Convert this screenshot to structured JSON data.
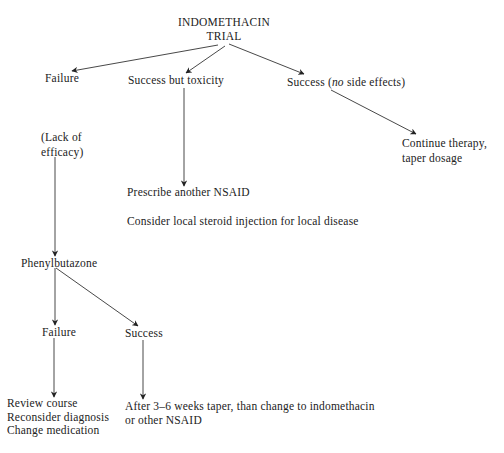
{
  "diagram": {
    "type": "flowchart",
    "nodes": {
      "root": {
        "lines": [
          "INDOMETHACIN",
          "TRIAL"
        ]
      },
      "failure_1": {
        "label": "Failure"
      },
      "success_toxicity": {
        "label": "Success but toxicity"
      },
      "success_no_side": {
        "prefix": "Success (",
        "italic": "no",
        "suffix": " side effects)"
      },
      "lack_efficacy": {
        "lines": [
          "(Lack of",
          "efficacy)"
        ]
      },
      "prescribe_nsaid": {
        "label": "Prescribe another NSAID"
      },
      "consider_steroid": {
        "label": "Consider local steroid injection for local disease"
      },
      "continue_therapy": {
        "lines": [
          "Continue therapy,",
          "taper dosage"
        ]
      },
      "phenylbutazone": {
        "label": "Phenylbutazone"
      },
      "failure_2": {
        "label": "Failure"
      },
      "success_2": {
        "label": "Success"
      },
      "review_course": {
        "lines": [
          "Review course",
          "Reconsider diagnosis",
          "Change medication"
        ]
      },
      "after_taper": {
        "lines": [
          "After 3–6 weeks taper, than change to indomethacin",
          "or other NSAID"
        ]
      }
    },
    "edges": [
      {
        "from": "root",
        "to": "failure_1"
      },
      {
        "from": "root",
        "to": "success_toxicity"
      },
      {
        "from": "root",
        "to": "success_no_side"
      },
      {
        "from": "success_no_side",
        "to": "continue_therapy"
      },
      {
        "from": "success_toxicity",
        "to": "prescribe_nsaid"
      },
      {
        "from": "lack_efficacy",
        "to": "phenylbutazone"
      },
      {
        "from": "phenylbutazone",
        "to": "failure_2"
      },
      {
        "from": "phenylbutazone",
        "to": "success_2"
      },
      {
        "from": "failure_2",
        "to": "review_course"
      },
      {
        "from": "success_2",
        "to": "after_taper"
      }
    ]
  }
}
